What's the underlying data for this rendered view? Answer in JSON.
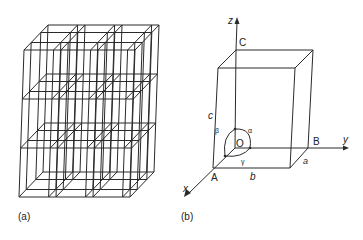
{
  "figure": {
    "panel_a": {
      "caption": "(a)",
      "description": "3D lattice of 3x3x... stacked unit cells (parallelepiped grid)"
    },
    "panel_b": {
      "caption": "(b)",
      "axes": {
        "x": "x",
        "y": "y",
        "z": "z"
      },
      "points": {
        "origin": "O",
        "A": "A",
        "B": "B",
        "C": "C"
      },
      "edges": {
        "a": "a",
        "b": "b",
        "c": "c"
      },
      "angles": {
        "alpha": "α",
        "beta": "β",
        "gamma": "γ"
      }
    }
  }
}
